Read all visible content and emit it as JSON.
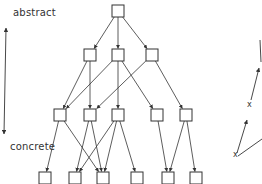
{
  "labels": {
    "top": "abstract",
    "bottom": "concrete"
  },
  "side_marks": [
    "x",
    "x"
  ],
  "colors": {
    "stroke": "#333333",
    "node_fill": "#ffffff",
    "background": "#ffffff"
  },
  "graph": {
    "levels": [
      {
        "name": "level-0",
        "nodes": [
          {
            "id": "n0",
            "x": 118,
            "y": 11
          }
        ]
      },
      {
        "name": "level-1",
        "nodes": [
          {
            "id": "n1a",
            "x": 90,
            "y": 55
          },
          {
            "id": "n1b",
            "x": 118,
            "y": 55
          },
          {
            "id": "n1c",
            "x": 152,
            "y": 55
          }
        ]
      },
      {
        "name": "level-2",
        "nodes": [
          {
            "id": "n2a",
            "x": 60,
            "y": 115
          },
          {
            "id": "n2b",
            "x": 90,
            "y": 115
          },
          {
            "id": "n2c",
            "x": 118,
            "y": 115
          },
          {
            "id": "n2d",
            "x": 157,
            "y": 115
          },
          {
            "id": "n2e",
            "x": 186,
            "y": 115
          }
        ]
      },
      {
        "name": "level-3",
        "nodes": [
          {
            "id": "n3a",
            "x": 45,
            "y": 178
          },
          {
            "id": "n3b",
            "x": 75,
            "y": 178
          },
          {
            "id": "n3c",
            "x": 103,
            "y": 178
          },
          {
            "id": "n3d",
            "x": 137,
            "y": 178
          },
          {
            "id": "n3e",
            "x": 168,
            "y": 178
          },
          {
            "id": "n3f",
            "x": 196,
            "y": 178
          }
        ]
      }
    ],
    "edges": [
      [
        "n0",
        "n1a"
      ],
      [
        "n0",
        "n1b"
      ],
      [
        "n0",
        "n1c"
      ],
      [
        "n1a",
        "n2a"
      ],
      [
        "n1a",
        "n2b"
      ],
      [
        "n1b",
        "n2a"
      ],
      [
        "n1b",
        "n2c"
      ],
      [
        "n1b",
        "n2d"
      ],
      [
        "n1c",
        "n2b"
      ],
      [
        "n1c",
        "n2e"
      ],
      [
        "n2a",
        "n3a"
      ],
      [
        "n2a",
        "n3c"
      ],
      [
        "n2b",
        "n3b"
      ],
      [
        "n2b",
        "n3c"
      ],
      [
        "n2c",
        "n3b"
      ],
      [
        "n2c",
        "n3c"
      ],
      [
        "n2c",
        "n3d"
      ],
      [
        "n2d",
        "n3e"
      ],
      [
        "n2e",
        "n3e"
      ],
      [
        "n2e",
        "n3f"
      ]
    ]
  }
}
